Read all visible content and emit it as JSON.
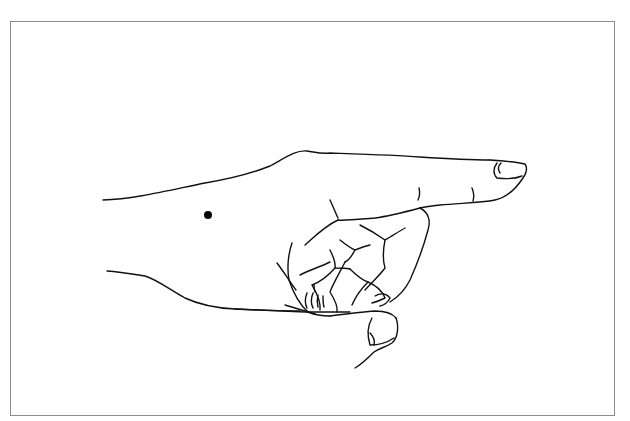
{
  "figure": {
    "marker": {
      "shape": "dot",
      "color": "#000000",
      "cx": 208,
      "cy": 215,
      "r": 4
    },
    "frame_color": "#8c8c8c",
    "line_color": "#111111",
    "caption": ""
  }
}
